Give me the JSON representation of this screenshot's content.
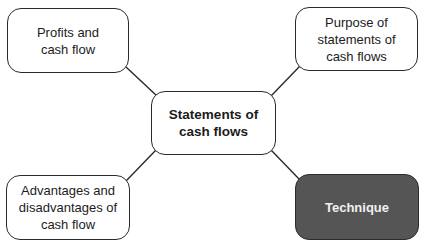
{
  "diagram": {
    "type": "mind-map",
    "center": {
      "label": "Statements of cash flows"
    },
    "nodes": [
      {
        "id": "profits",
        "label": "Profits and cash flow",
        "position": "top-left",
        "highlighted": false
      },
      {
        "id": "purpose",
        "label": "Purpose of statements of cash flows",
        "position": "top-right",
        "highlighted": false
      },
      {
        "id": "advantages",
        "label": "Advantages and disadvantages of cash flow",
        "position": "bottom-left",
        "highlighted": false
      },
      {
        "id": "technique",
        "label": "Technique",
        "position": "bottom-right",
        "highlighted": true
      }
    ],
    "edges": [
      {
        "from": "center",
        "to": "profits"
      },
      {
        "from": "center",
        "to": "purpose"
      },
      {
        "from": "center",
        "to": "advantages"
      },
      {
        "from": "center",
        "to": "technique"
      }
    ],
    "colors": {
      "border": "#2a2a2a",
      "highlight_fill": "#555555",
      "highlight_text": "#f0f0f0",
      "text": "#1c1c1c",
      "background": "#ffffff"
    }
  }
}
